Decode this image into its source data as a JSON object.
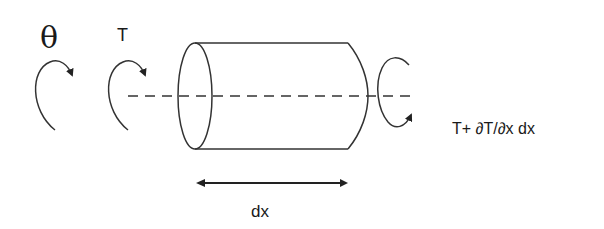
{
  "diagram": {
    "labels": {
      "theta": "θ",
      "torque": "T",
      "torque_increment": "T+ ∂T/∂x dx",
      "length": "dx"
    },
    "elements": [
      {
        "type": "rotation-arrow",
        "label": "theta",
        "direction": "clockwise"
      },
      {
        "type": "rotation-arrow",
        "label": "torque",
        "direction": "clockwise"
      },
      {
        "type": "cylinder",
        "description": "shaft element of length dx"
      },
      {
        "type": "axis",
        "style": "dashed"
      },
      {
        "type": "rotation-arrow",
        "label": "torque_increment",
        "direction": "counter-clockwise"
      },
      {
        "type": "dimension-arrow",
        "label": "length"
      }
    ],
    "colors": {
      "stroke": "#333333",
      "background": "#ffffff"
    }
  }
}
